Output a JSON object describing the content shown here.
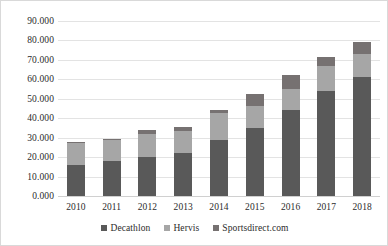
{
  "chart_data": {
    "type": "bar",
    "subtype": "stacked-column",
    "title": "",
    "xlabel": "",
    "ylabel": "",
    "categories": [
      "2010",
      "2011",
      "2012",
      "2013",
      "2014",
      "2015",
      "2016",
      "2017",
      "2018"
    ],
    "series": [
      {
        "name": "Decathlon",
        "color": "#595959",
        "values": [
          16000,
          18000,
          20000,
          22000,
          29000,
          35000,
          44000,
          54000,
          61000
        ]
      },
      {
        "name": "Hervis",
        "color": "#a6a6a6",
        "values": [
          11500,
          11000,
          12000,
          11500,
          13500,
          11500,
          11000,
          13000,
          12000
        ]
      },
      {
        "name": "Sportsdirect.com",
        "color": "#767171",
        "values": [
          500,
          500,
          2000,
          2000,
          2000,
          6000,
          7500,
          4500,
          6000
        ]
      }
    ],
    "totals": [
      28000,
      29500,
      34000,
      35500,
      44500,
      52500,
      62500,
      71500,
      79000
    ],
    "ylim": [
      0,
      90000
    ],
    "ytick_step": 10000,
    "ytick_labels": [
      "0.000",
      "10.000",
      "20.000",
      "30.000",
      "40.000",
      "50.000",
      "60.000",
      "70.000",
      "80.000",
      "90.000"
    ],
    "grid": true,
    "legend_position": "bottom"
  },
  "legend": {
    "items": [
      {
        "label": "Decathlon",
        "color": "#595959"
      },
      {
        "label": "Hervis",
        "color": "#a6a6a6"
      },
      {
        "label": "Sportsdirect.com",
        "color": "#767171"
      }
    ]
  }
}
